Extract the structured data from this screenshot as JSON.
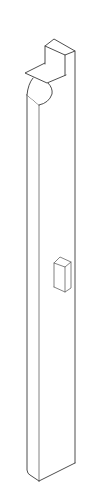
{
  "drawing": {
    "type": "isometric line drawing",
    "subject": "vertical post with top notch block, curved cutout and small rectangular lug",
    "background": "#ffffff",
    "line_color": "#3a3a3a",
    "parts": [
      {
        "name": "top-block"
      },
      {
        "name": "ledge"
      },
      {
        "name": "curved-cutout"
      },
      {
        "name": "main-post"
      },
      {
        "name": "side-lug"
      }
    ]
  }
}
